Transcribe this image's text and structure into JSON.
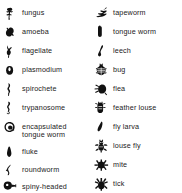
{
  "figure": {
    "kind": "parasite-symbol-legend",
    "background_color": "#ffffff",
    "text_color": "#1a1a1a",
    "icon_color": "#111111",
    "columns": 2
  },
  "columns": {
    "left": {
      "items": [
        {
          "label": "fungus",
          "icon": "fungus-icon",
          "y": 6,
          "multiline": false
        },
        {
          "label": "amoeba",
          "icon": "amoeba-icon",
          "y": 25,
          "multiline": false
        },
        {
          "label": "flagellate",
          "icon": "flagellate-icon",
          "y": 44,
          "multiline": false
        },
        {
          "label": "plasmodium",
          "icon": "plasmodium-icon",
          "y": 63,
          "multiline": false
        },
        {
          "label": "spirochete",
          "icon": "spirochete-icon",
          "y": 82,
          "multiline": false
        },
        {
          "label": "trypanosome",
          "icon": "trypanosome-icon",
          "y": 101,
          "multiline": false
        },
        {
          "label": "encapsulated\ntongue worm",
          "icon": "encapsulated-tongue-worm-icon",
          "y": 120,
          "multiline": true
        },
        {
          "label": "fluke",
          "icon": "fluke-icon",
          "y": 145,
          "multiline": false
        },
        {
          "label": "roundworm",
          "icon": "roundworm-icon",
          "y": 163,
          "multiline": false
        },
        {
          "label": "spiny-headed\nworm",
          "icon": "spiny-headed-worm-icon",
          "y": 180,
          "multiline": true
        }
      ]
    },
    "right": {
      "items": [
        {
          "label": "tapeworm",
          "icon": "tapeworm-icon",
          "y": 6,
          "multiline": false
        },
        {
          "label": "tongue worm",
          "icon": "tongue-worm-icon",
          "y": 25,
          "multiline": false
        },
        {
          "label": "leech",
          "icon": "leech-icon",
          "y": 44,
          "multiline": false
        },
        {
          "label": "bug",
          "icon": "bug-icon",
          "y": 63,
          "multiline": false
        },
        {
          "label": "flea",
          "icon": "flea-icon",
          "y": 82,
          "multiline": false
        },
        {
          "label": "feather louse",
          "icon": "feather-louse-icon",
          "y": 101,
          "multiline": false
        },
        {
          "label": "fly larva",
          "icon": "fly-larva-icon",
          "y": 120,
          "multiline": false
        },
        {
          "label": "louse fly",
          "icon": "louse-fly-icon",
          "y": 139,
          "multiline": false
        },
        {
          "label": "mite",
          "icon": "mite-icon",
          "y": 158,
          "multiline": false
        },
        {
          "label": "tick",
          "icon": "tick-icon",
          "y": 177,
          "multiline": false
        }
      ]
    }
  }
}
